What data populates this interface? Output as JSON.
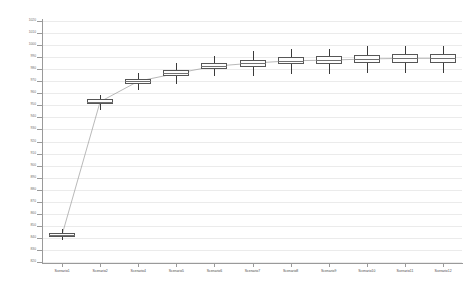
{
  "chart_data": {
    "type": "boxplot",
    "title": "",
    "xlabel": "",
    "ylabel": "",
    "ylim": [
      820,
      1020
    ],
    "ytick_step": 10,
    "grid": true,
    "legend": null,
    "categories": [
      "Scenario1",
      "Scenario2",
      "Scenario4",
      "Scenario5",
      "Scenario6",
      "Scenario7",
      "Scenario8",
      "Scenario9",
      "Scenario10",
      "Scenario11",
      "Scenario12"
    ],
    "ytick_labels": [
      "1020",
      "1010",
      "1000",
      "990",
      "980",
      "970",
      "960",
      "950",
      "940",
      "930",
      "920",
      "910",
      "900",
      "890",
      "880",
      "870",
      "860",
      "850",
      "840",
      "830",
      "820"
    ],
    "boxes": [
      {
        "category": "Scenario1",
        "whisker_low": 838.0,
        "q1": 841.0,
        "median": 842.5,
        "q3": 844.0,
        "whisker_high": 847.0,
        "mean": 842.5
      },
      {
        "category": "Scenario2",
        "whisker_low": 946.0,
        "q1": 951.0,
        "median": 953.0,
        "q3": 955.0,
        "whisker_high": 958.5,
        "mean": 953.0
      },
      {
        "category": "Scenario4",
        "whisker_low": 963.0,
        "q1": 968.0,
        "median": 970.0,
        "q3": 972.0,
        "whisker_high": 977.0,
        "mean": 970.0
      },
      {
        "category": "Scenario5",
        "whisker_low": 968.0,
        "q1": 974.0,
        "median": 976.5,
        "q3": 979.0,
        "whisker_high": 985.0,
        "mean": 976.5
      },
      {
        "category": "Scenario6",
        "whisker_low": 974.0,
        "q1": 980.0,
        "median": 982.5,
        "q3": 985.0,
        "whisker_high": 991.0,
        "mean": 982.5
      },
      {
        "category": "Scenario7",
        "whisker_low": 974.0,
        "q1": 982.0,
        "median": 985.0,
        "q3": 988.0,
        "whisker_high": 995.0,
        "mean": 985.0
      },
      {
        "category": "Scenario8",
        "whisker_low": 976.0,
        "q1": 984.0,
        "median": 987.0,
        "q3": 990.0,
        "whisker_high": 997.0,
        "mean": 987.0
      },
      {
        "category": "Scenario9",
        "whisker_low": 976.0,
        "q1": 984.0,
        "median": 987.5,
        "q3": 991.0,
        "whisker_high": 997.0,
        "mean": 987.5
      },
      {
        "category": "Scenario10",
        "whisker_low": 977.0,
        "q1": 985.0,
        "median": 988.5,
        "q3": 992.0,
        "whisker_high": 999.0,
        "mean": 988.5
      },
      {
        "category": "Scenario11",
        "whisker_low": 977.0,
        "q1": 985.0,
        "median": 989.0,
        "q3": 993.0,
        "whisker_high": 999.0,
        "mean": 989.0
      },
      {
        "category": "Scenario12",
        "whisker_low": 977.0,
        "q1": 985.0,
        "median": 989.0,
        "q3": 993.0,
        "whisker_high": 999.0,
        "mean": 989.0
      }
    ],
    "mean_connector": {
      "visible": true,
      "values": [
        842.5,
        953.0,
        970.0,
        976.5,
        982.5,
        985.0,
        987.0,
        987.5,
        988.5,
        989.0,
        989.0
      ]
    },
    "colors": {
      "box_stroke": "#565656",
      "box_fill": "#fdfdfd",
      "whisker": "#3a3a3a",
      "median": "#707070",
      "connector": "#9b9b9b",
      "axis": "#9a9a9a",
      "grid": "#bebebe",
      "tick_label": "#6d6d6d",
      "background": "#ffffff"
    }
  }
}
